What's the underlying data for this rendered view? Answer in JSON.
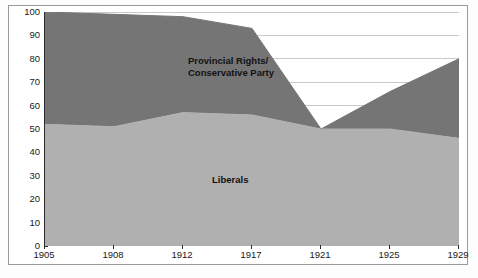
{
  "figure": {
    "caption": ""
  },
  "axes": {
    "y_ticks": [
      "0",
      "10",
      "20",
      "30",
      "40",
      "50",
      "60",
      "70",
      "80",
      "90",
      "100"
    ],
    "x_ticks": [
      "1905",
      "1908",
      "1912",
      "1917",
      "1921",
      "1925",
      "1929"
    ]
  },
  "labels": {
    "conservative_line1": "Provincial Rights/",
    "conservative_line2": "Conservative Party",
    "liberals": "Liberals"
  },
  "colors": {
    "conservative": "#757575",
    "liberals": "#b0b0b0",
    "gridline": "#c9c9c9",
    "axis": "#2b2b2b",
    "frame": "#9a9a9a",
    "background": "#ffffff"
  },
  "chart_data": {
    "type": "area",
    "title": "",
    "xlabel": "",
    "ylabel": "",
    "ylim": [
      0,
      100
    ],
    "yticks": [
      0,
      10,
      20,
      30,
      40,
      50,
      60,
      70,
      80,
      90,
      100
    ],
    "grid": true,
    "legend_position": "inside-areas",
    "stacked": false,
    "categories": [
      "1905",
      "1908",
      "1912",
      "1917",
      "1921",
      "1925",
      "1929"
    ],
    "series": [
      {
        "name": "Liberals",
        "color": "#b0b0b0",
        "values": [
          52,
          51,
          57,
          56,
          50,
          50,
          46
        ]
      },
      {
        "name": "Provincial Rights/Conservative Party",
        "color": "#757575",
        "values": [
          100,
          99,
          98,
          93,
          50,
          66,
          80
        ]
      }
    ]
  }
}
